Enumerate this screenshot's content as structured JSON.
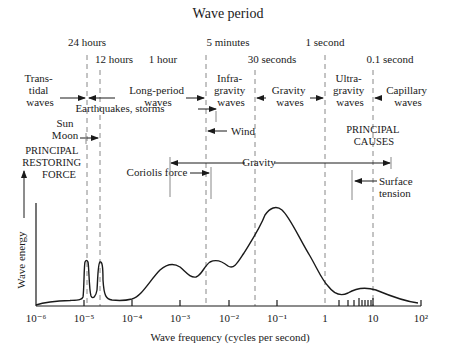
{
  "title": "Wave period",
  "periods": [
    {
      "label": "24 hours",
      "x": 87,
      "y": 43
    },
    {
      "label": "12 hours",
      "x": 112,
      "y": 60
    },
    {
      "label": "1 hour",
      "x": 170,
      "y": 60
    },
    {
      "label": "5 minutes",
      "x": 226,
      "y": 43
    },
    {
      "label": "30 seconds",
      "x": 265,
      "y": 60
    },
    {
      "label": "1 second",
      "x": 325,
      "y": 43
    },
    {
      "label": "0.1 second",
      "x": 390,
      "y": 60
    }
  ],
  "wave_types": {
    "transtidal": [
      "Trans-",
      "tidal",
      "waves"
    ],
    "long_period": [
      "Long-period",
      "waves"
    ],
    "infragravity": [
      "Infra-",
      "gravity",
      "waves"
    ],
    "gravity": [
      "Gravity",
      "waves"
    ],
    "ultragravity": [
      "Ultra-",
      "gravity",
      "waves"
    ],
    "capillary": [
      "Capillary",
      "waves"
    ]
  },
  "causes": {
    "earthquakes": "Earthquakes, storms",
    "wind": "Wind",
    "sun": "Sun",
    "moon": "Moon",
    "principal_causes": [
      "PRINCIPAL",
      "CAUSES"
    ],
    "principal_force": [
      "PRINCIPAL",
      "RESTORING",
      "FORCE"
    ],
    "gravity": "Gravity",
    "coriolis": "Coriolis force",
    "surface_tension": [
      "Surface",
      "tension"
    ]
  },
  "axes": {
    "xlabel": "Wave frequency (cycles per second)",
    "ylabel": "Wave energy",
    "xticks": [
      "10⁻⁶",
      "10⁻⁵",
      "10⁻⁴",
      "10⁻³",
      "10⁻²",
      "10⁻¹",
      "1",
      "10",
      "10²"
    ]
  },
  "colors": {
    "ink": "#1a1a1a",
    "dash": "#888888"
  }
}
